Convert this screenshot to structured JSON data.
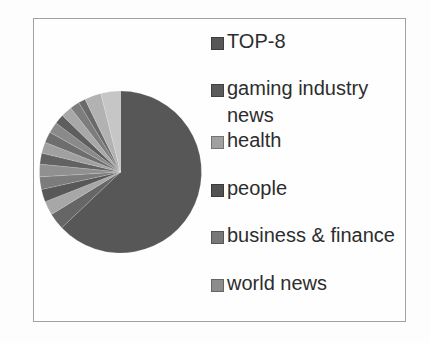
{
  "figure": {
    "background_color": "#fdfdfd",
    "frame_border_color": "#a2a2a2"
  },
  "chart_data": {
    "type": "pie",
    "title": "",
    "legend_position": "right",
    "start_angle_deg": 0,
    "direction": "clockwise",
    "categories": [
      "TOP-8",
      "gaming industry news",
      "health",
      "people",
      "business & finance",
      "world news"
    ],
    "slices": [
      {
        "label": "TOP-8",
        "percent": 62.8,
        "color": "#575757"
      },
      {
        "label": "gaming industry news",
        "percent": 3.3,
        "color": "#666666"
      },
      {
        "label": "health",
        "percent": 2.8,
        "color": "#a7a7a7"
      },
      {
        "label": "people",
        "percent": 2.5,
        "color": "#585858"
      },
      {
        "label": "business & finance",
        "percent": 2.5,
        "color": "#7c7c7c"
      },
      {
        "label": "world news",
        "percent": 2.5,
        "color": "#909090"
      },
      {
        "label": "",
        "percent": 2.2,
        "color": "#626262"
      },
      {
        "label": "",
        "percent": 2.2,
        "color": "#a0a0a0"
      },
      {
        "label": "",
        "percent": 2.2,
        "color": "#6e6e6e"
      },
      {
        "label": "",
        "percent": 2.2,
        "color": "#8a8a8a"
      },
      {
        "label": "",
        "percent": 1.9,
        "color": "#5e5e5e"
      },
      {
        "label": "",
        "percent": 2.2,
        "color": "#a8a8a8"
      },
      {
        "label": "",
        "percent": 1.9,
        "color": "#7d7d7d"
      },
      {
        "label": "",
        "percent": 1.4,
        "color": "#6a6a6a"
      },
      {
        "label": "",
        "percent": 3.3,
        "color": "#b2b2b2"
      },
      {
        "label": "",
        "percent": 3.9,
        "color": "#c6c6c6"
      }
    ]
  },
  "legend": {
    "items": [
      {
        "label": "TOP-8",
        "color": "#575757"
      },
      {
        "label": "gaming industry news",
        "color": "#5a5a5a"
      },
      {
        "label": "health",
        "color": "#a0a0a0"
      },
      {
        "label": "people",
        "color": "#525252"
      },
      {
        "label": "business & finance",
        "color": "#787878"
      },
      {
        "label": "world news",
        "color": "#8c8c8c"
      }
    ]
  }
}
